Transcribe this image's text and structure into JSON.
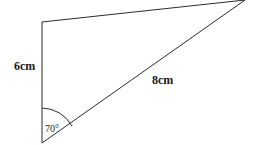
{
  "diagram": {
    "type": "triangle",
    "vertices": {
      "top_left": [
        42,
        22
      ],
      "bottom": [
        42,
        143
      ],
      "top_right": [
        245,
        0
      ]
    },
    "labels": {
      "side_vertical": "6cm",
      "side_hypotenuse": "8cm",
      "angle_bottom": "70°"
    },
    "colors": {
      "stroke": "#2a2a2a",
      "background": "#ffffff"
    }
  }
}
